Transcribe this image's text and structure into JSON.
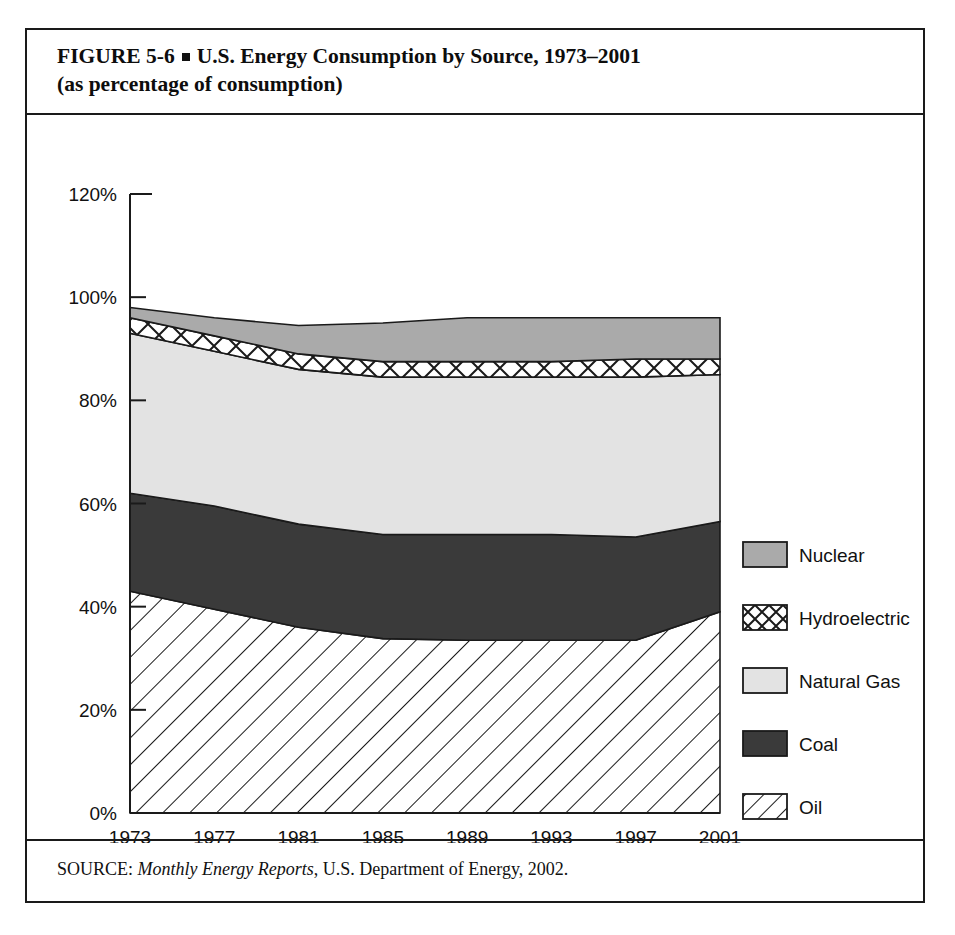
{
  "figure": {
    "label": "FIGURE  5-6",
    "bullet": "square-bullet",
    "title_line1": "U.S. Energy Consumption by Source, 1973–2001",
    "title_line2": "(as percentage of consumption)",
    "source_prefix": "SOURCE:",
    "source_italic": "Monthly Energy Reports",
    "source_rest": ", U.S. Department of Energy, 2002."
  },
  "chart_data": {
    "type": "area",
    "stacked": true,
    "title": "U.S. Energy Consumption by Source, 1973–2001 (as percentage of consumption)",
    "xlabel": "",
    "ylabel": "",
    "grid": false,
    "legend_position": "right",
    "x": [
      1973,
      1977,
      1981,
      1985,
      1989,
      1993,
      1997,
      2001
    ],
    "categories": [
      "1973",
      "1977",
      "1981",
      "1985",
      "1989",
      "1993",
      "1997",
      "2001"
    ],
    "xtick_labels": [
      "1973",
      "1977",
      "1981",
      "1985",
      "1989",
      "1993",
      "1997",
      "2001"
    ],
    "ytick_labels": [
      "0%",
      "20%",
      "40%",
      "60%",
      "80%",
      "100%",
      "120%"
    ],
    "ytick_values": [
      0,
      20,
      40,
      60,
      80,
      100,
      120
    ],
    "ylim": [
      0,
      120
    ],
    "xlim": [
      1973,
      2001
    ],
    "series": [
      {
        "name": "Oil",
        "pattern": "diagonal-hatch",
        "color": "#ffffff",
        "values": [
          43.0,
          39.5,
          36.0,
          33.8,
          33.5,
          33.5,
          33.5,
          39.0
        ],
        "cumulative_top": [
          43.0,
          39.5,
          36.0,
          33.8,
          33.5,
          33.5,
          33.5,
          39.0
        ]
      },
      {
        "name": "Coal",
        "pattern": "solid",
        "color": "#3a3a3a",
        "values": [
          19.0,
          20.0,
          20.0,
          20.2,
          20.5,
          20.5,
          20.0,
          17.5
        ],
        "cumulative_top": [
          62.0,
          59.5,
          56.0,
          54.0,
          54.0,
          54.0,
          53.5,
          56.5
        ]
      },
      {
        "name": "Natural Gas",
        "pattern": "solid",
        "color": "#e3e3e3",
        "values": [
          31.0,
          30.0,
          30.0,
          30.5,
          30.5,
          30.5,
          31.0,
          28.5
        ],
        "cumulative_top": [
          93.0,
          89.5,
          86.0,
          84.5,
          84.5,
          84.5,
          84.5,
          85.0
        ]
      },
      {
        "name": "Hydroelectric",
        "pattern": "crosshatch",
        "color": "#ffffff",
        "values": [
          3.0,
          3.0,
          3.0,
          3.0,
          3.0,
          3.0,
          3.5,
          3.0
        ],
        "cumulative_top": [
          96.0,
          92.5,
          89.0,
          87.5,
          87.5,
          87.5,
          88.0,
          88.0
        ]
      },
      {
        "name": "Nuclear",
        "pattern": "solid",
        "color": "#aaaaaa",
        "values": [
          2.0,
          3.5,
          5.5,
          7.5,
          8.5,
          8.5,
          8.0,
          8.0
        ],
        "cumulative_top": [
          98.0,
          96.0,
          94.5,
          95.0,
          96.0,
          96.0,
          96.0,
          96.0
        ]
      }
    ]
  },
  "legend": {
    "items": [
      {
        "label": "Nuclear",
        "swatch": "nuclear-swatch"
      },
      {
        "label": "Hydroelectric",
        "swatch": "hydroelectric-swatch"
      },
      {
        "label": "Natural Gas",
        "swatch": "natural-gas-swatch"
      },
      {
        "label": "Coal",
        "swatch": "coal-swatch"
      },
      {
        "label": "Oil",
        "swatch": "oil-swatch"
      }
    ]
  }
}
